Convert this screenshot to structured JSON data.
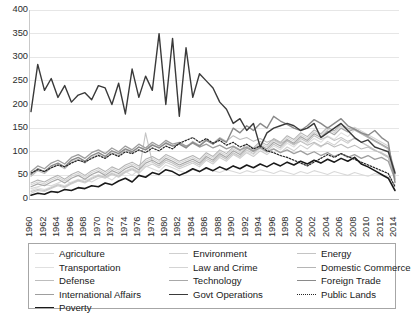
{
  "chart_data": {
    "type": "line",
    "title": "",
    "xlabel": "",
    "ylabel": "",
    "ylim": [
      0,
      400
    ],
    "ytick_step": 50,
    "yticks": [
      "400",
      "350",
      "300",
      "250",
      "200",
      "150",
      "100",
      "50",
      "0"
    ],
    "grid": true,
    "legend_position": "bottom",
    "x": [
      1960,
      1961,
      1962,
      1963,
      1964,
      1965,
      1966,
      1967,
      1968,
      1969,
      1970,
      1971,
      1972,
      1973,
      1974,
      1975,
      1976,
      1977,
      1978,
      1979,
      1980,
      1981,
      1982,
      1983,
      1984,
      1985,
      1986,
      1987,
      1988,
      1989,
      1990,
      1991,
      1992,
      1993,
      1994,
      1995,
      1996,
      1997,
      1998,
      1999,
      2000,
      2001,
      2002,
      2003,
      2004,
      2005,
      2006,
      2007,
      2008,
      2009,
      2010,
      2011,
      2012,
      2013,
      2014
    ],
    "xtick_labels": [
      "1960",
      "1962",
      "1964",
      "1966",
      "1968",
      "1970",
      "1972",
      "1974",
      "1976",
      "1978",
      "1980",
      "1982",
      "1984",
      "1986",
      "1988",
      "1990",
      "1992",
      "1994",
      "1996",
      "1998",
      "2000",
      "2002",
      "2004",
      "2006",
      "2008",
      "2010",
      "2012",
      "2014"
    ],
    "series": [
      {
        "name": "Agriculture",
        "color": "#d9d9d9",
        "width": 1.1,
        "dash": "none",
        "values": [
          22,
          26,
          30,
          28,
          34,
          40,
          33,
          38,
          42,
          36,
          44,
          48,
          40,
          52,
          58,
          50,
          62,
          70,
          64,
          58,
          72,
          66,
          60,
          55,
          62,
          58,
          64,
          60,
          56,
          62,
          58,
          54,
          60,
          56,
          62,
          58,
          54,
          60,
          56,
          52,
          58,
          54,
          60,
          56,
          52,
          58,
          54,
          50,
          56,
          52,
          48,
          54,
          50,
          46,
          30
        ]
      },
      {
        "name": "Transportation",
        "color": "#e0e0e0",
        "width": 1.1,
        "dash": "none",
        "values": [
          18,
          24,
          20,
          26,
          32,
          28,
          36,
          42,
          38,
          46,
          52,
          48,
          56,
          50,
          60,
          66,
          58,
          72,
          78,
          70,
          82,
          76,
          68,
          74,
          80,
          72,
          86,
          78,
          92,
          84,
          96,
          88,
          100,
          94,
          106,
          98,
          112,
          104,
          118,
          110,
          124,
          116,
          128,
          120,
          134,
          126,
          140,
          132,
          146,
          138,
          130,
          122,
          114,
          106,
          60
        ]
      },
      {
        "name": "Defense",
        "color": "#bdbdbd",
        "width": 1.1,
        "dash": "none",
        "values": [
          48,
          60,
          54,
          66,
          72,
          64,
          78,
          84,
          76,
          88,
          94,
          86,
          98,
          92,
          104,
          98,
          110,
          104,
          116,
          108,
          120,
          112,
          118,
          110,
          122,
          114,
          126,
          118,
          130,
          122,
          134,
          126,
          130,
          122,
          128,
          120,
          126,
          118,
          124,
          116,
          122,
          114,
          120,
          112,
          118,
          110,
          116,
          108,
          114,
          106,
          110,
          102,
          98,
          90,
          48
        ]
      },
      {
        "name": "International Affairs",
        "color": "#9e9e9e",
        "width": 1.3,
        "dash": "none",
        "values": [
          58,
          70,
          64,
          76,
          82,
          74,
          88,
          94,
          86,
          98,
          104,
          96,
          108,
          100,
          112,
          104,
          116,
          108,
          120,
          112,
          124,
          116,
          120,
          112,
          118,
          110,
          116,
          108,
          114,
          106,
          112,
          104,
          110,
          102,
          108,
          100,
          106,
          98,
          104,
          96,
          102,
          94,
          100,
          92,
          98,
          90,
          96,
          88,
          94,
          86,
          92,
          84,
          88,
          80,
          42
        ]
      },
      {
        "name": "Poverty",
        "color": "#1a1a1a",
        "width": 1.6,
        "dash": "none",
        "values": [
          8,
          12,
          10,
          16,
          14,
          20,
          18,
          24,
          22,
          28,
          26,
          34,
          30,
          38,
          44,
          36,
          50,
          46,
          56,
          52,
          62,
          58,
          50,
          56,
          64,
          58,
          66,
          60,
          68,
          62,
          70,
          64,
          72,
          66,
          74,
          68,
          76,
          70,
          78,
          72,
          80,
          74,
          82,
          76,
          84,
          78,
          86,
          80,
          88,
          74,
          68,
          60,
          52,
          44,
          18
        ]
      },
      {
        "name": "Environment",
        "color": "#cfcfcf",
        "width": 1.1,
        "dash": "none",
        "values": [
          12,
          18,
          16,
          22,
          28,
          24,
          32,
          38,
          34,
          42,
          48,
          44,
          52,
          46,
          56,
          62,
          54,
          68,
          74,
          66,
          78,
          72,
          64,
          70,
          76,
          68,
          82,
          74,
          88,
          80,
          94,
          86,
          98,
          90,
          102,
          94,
          106,
          98,
          110,
          102,
          114,
          106,
          118,
          110,
          122,
          114,
          126,
          118,
          130,
          120,
          112,
          104,
          96,
          88,
          46
        ]
      },
      {
        "name": "Law and Crime",
        "color": "#d4d4d4",
        "width": 1.1,
        "dash": "none",
        "values": [
          30,
          36,
          32,
          40,
          46,
          38,
          48,
          54,
          46,
          56,
          62,
          54,
          64,
          58,
          68,
          74,
          66,
          80,
          86,
          78,
          90,
          84,
          76,
          82,
          88,
          80,
          94,
          86,
          100,
          92,
          106,
          98,
          112,
          104,
          118,
          110,
          124,
          116,
          130,
          122,
          136,
          128,
          142,
          134,
          148,
          140,
          154,
          146,
          152,
          144,
          136,
          128,
          120,
          112,
          58
        ]
      },
      {
        "name": "Technology",
        "color": "#a8a8a8",
        "width": 1.2,
        "dash": "none",
        "values": [
          26,
          32,
          28,
          36,
          42,
          34,
          44,
          50,
          42,
          52,
          58,
          50,
          60,
          54,
          64,
          70,
          62,
          76,
          82,
          74,
          86,
          80,
          72,
          78,
          84,
          76,
          90,
          82,
          96,
          88,
          102,
          94,
          108,
          100,
          114,
          106,
          120,
          112,
          126,
          118,
          132,
          124,
          138,
          130,
          144,
          136,
          150,
          142,
          148,
          140,
          132,
          124,
          116,
          108,
          54
        ]
      },
      {
        "name": "Govt Operations",
        "color": "#3a3a3a",
        "width": 1.4,
        "dash": "none",
        "values": [
          185,
          285,
          230,
          255,
          215,
          240,
          205,
          220,
          225,
          210,
          240,
          235,
          200,
          245,
          180,
          275,
          215,
          260,
          230,
          350,
          200,
          340,
          175,
          320,
          215,
          265,
          250,
          235,
          205,
          190,
          160,
          170,
          145,
          160,
          110,
          140,
          150,
          155,
          160,
          155,
          145,
          150,
          160,
          130,
          140,
          150,
          160,
          145,
          130,
          120,
          125,
          110,
          105,
          100,
          55
        ]
      },
      {
        "name": "Energy",
        "color": "#c4c4c4",
        "width": 1.1,
        "dash": "none",
        "values": [
          16,
          20,
          18,
          24,
          30,
          26,
          34,
          40,
          36,
          44,
          50,
          46,
          54,
          48,
          58,
          64,
          56,
          140,
          78,
          70,
          82,
          76,
          68,
          74,
          80,
          72,
          86,
          78,
          92,
          84,
          98,
          90,
          104,
          96,
          110,
          102,
          116,
          108,
          122,
          114,
          128,
          120,
          134,
          126,
          132,
          124,
          130,
          122,
          128,
          120,
          112,
          104,
          96,
          88,
          44
        ]
      },
      {
        "name": "Domestic Commerce",
        "color": "#b5b5b5",
        "width": 1.1,
        "dash": "none",
        "values": [
          34,
          40,
          36,
          44,
          50,
          42,
          52,
          58,
          50,
          60,
          66,
          58,
          68,
          62,
          72,
          78,
          70,
          84,
          90,
          82,
          94,
          88,
          80,
          86,
          92,
          84,
          98,
          90,
          104,
          96,
          110,
          102,
          116,
          108,
          122,
          114,
          128,
          120,
          134,
          126,
          140,
          132,
          146,
          138,
          152,
          144,
          158,
          150,
          146,
          138,
          130,
          122,
          114,
          106,
          52
        ]
      },
      {
        "name": "Foreign Trade",
        "color": "#8a8a8a",
        "width": 1.4,
        "dash": "none",
        "values": [
          52,
          64,
          58,
          70,
          76,
          68,
          82,
          88,
          80,
          92,
          98,
          90,
          102,
          96,
          106,
          100,
          110,
          104,
          114,
          108,
          118,
          112,
          116,
          108,
          120,
          112,
          124,
          116,
          128,
          120,
          150,
          140,
          155,
          145,
          160,
          150,
          175,
          165,
          158,
          150,
          145,
          155,
          168,
          160,
          150,
          160,
          170,
          155,
          148,
          140,
          135,
          145,
          130,
          120,
          35
        ]
      },
      {
        "name": "Public Lands",
        "color": "#262626",
        "width": 1.2,
        "dash": "dotted",
        "values": [
          55,
          62,
          58,
          66,
          72,
          68,
          76,
          82,
          78,
          86,
          92,
          86,
          96,
          90,
          100,
          96,
          104,
          98,
          108,
          102,
          112,
          106,
          118,
          124,
          130,
          120,
          128,
          118,
          124,
          114,
          120,
          110,
          116,
          106,
          112,
          102,
          98,
          92,
          88,
          82,
          76,
          70,
          78,
          86,
          94,
          88,
          96,
          90,
          84,
          78,
          72,
          66,
          60,
          54,
          26
        ]
      }
    ]
  }
}
